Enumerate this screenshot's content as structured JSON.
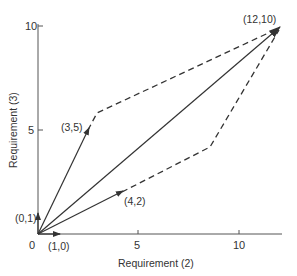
{
  "diagram": {
    "x_axis": {
      "label": "Requirement (2)",
      "ticks": [
        {
          "value": 0,
          "label": "0"
        },
        {
          "value": 5,
          "label": "5"
        },
        {
          "value": 10,
          "label": "10"
        }
      ]
    },
    "y_axis": {
      "label": "Requirement (3)",
      "ticks": [
        {
          "value": 5,
          "label": "5"
        },
        {
          "value": 10,
          "label": "10"
        }
      ]
    },
    "vectors": [
      {
        "label": "(0,1)",
        "x": 0,
        "y": 1
      },
      {
        "label": "(1,0)",
        "x": 1,
        "y": 0
      },
      {
        "label": "(3,5)",
        "x": 3,
        "y": 5
      },
      {
        "label": "(4,2)",
        "x": 4,
        "y": 2
      },
      {
        "label": "(12,10)",
        "x": 12,
        "y": 10
      }
    ],
    "dashed_paths": [
      {
        "name": "upper-path",
        "description": "from (3,5) to (12,10)"
      },
      {
        "name": "lower-path",
        "description": "from (4,2) to (12,10)"
      }
    ],
    "colors": {
      "ink": "#333333",
      "axis": "#555555",
      "background": "#ffffff"
    }
  }
}
